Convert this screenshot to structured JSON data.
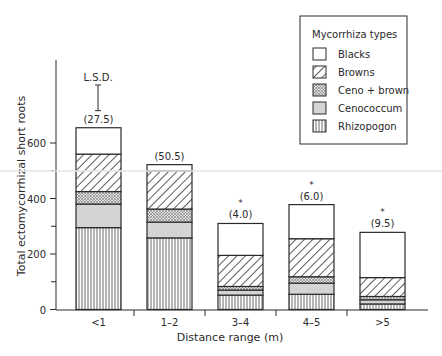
{
  "chart_data": {
    "type": "bar",
    "stacked": true,
    "title": "",
    "xlabel": "Distance range (m)",
    "ylabel": "Total ectomycorrhizal short roots",
    "ylim": [
      0,
      750
    ],
    "yticks": [
      0,
      200,
      400,
      600
    ],
    "yminor_ticks": [
      100,
      300,
      500
    ],
    "grid": false,
    "legend_position": "top-right (boxed)",
    "legend_title": "Mycorrhiza types",
    "categories": [
      "<1",
      "1–2",
      "3–4",
      "4–5",
      ">5"
    ],
    "series": [
      {
        "name": "Rhizopogon",
        "pattern": "vertical-lines",
        "values": [
          295,
          258,
          52,
          55,
          20
        ]
      },
      {
        "name": "Cenococcum",
        "pattern": "light-gray-fill",
        "values": [
          85,
          57,
          18,
          40,
          15
        ]
      },
      {
        "name": "Ceno + brown",
        "pattern": "stipple",
        "values": [
          45,
          47,
          13,
          23,
          12
        ]
      },
      {
        "name": "Browns",
        "pattern": "diagonal-hatch",
        "values": [
          135,
          138,
          112,
          137,
          68
        ]
      },
      {
        "name": "Blacks",
        "pattern": "white",
        "values": [
          95,
          22,
          115,
          123,
          163
        ]
      }
    ],
    "totals": [
      655,
      522,
      310,
      378,
      278
    ],
    "bar_annotations": [
      {
        "category": "<1",
        "text": "(27.5)",
        "asterisk": false
      },
      {
        "category": "1–2",
        "text": "(50.5)",
        "asterisk": false
      },
      {
        "category": "3–4",
        "text": "(4.0)",
        "asterisk": true
      },
      {
        "category": "4–5",
        "text": "(6.0)",
        "asterisk": true
      },
      {
        "category": ">5",
        "text": "(9.5)",
        "asterisk": true
      }
    ],
    "lsd_label": "L.S.D.",
    "lsd_bar_height": 95
  },
  "legend": {
    "title": "Mycorrhiza types",
    "items": [
      "Blacks",
      "Browns",
      "Ceno + brown",
      "Cenococcum",
      "Rhizopogon"
    ]
  },
  "colors": {
    "ink": "#2a2a2a",
    "cenococcum_fill": "#d4d4d4",
    "background": "#ffffff"
  }
}
